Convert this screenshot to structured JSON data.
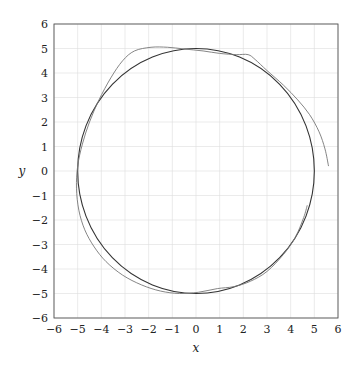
{
  "chart_data": {
    "type": "line",
    "title": "",
    "xlabel": "x",
    "ylabel": "y",
    "xlim": [
      -6,
      6
    ],
    "ylim": [
      -6,
      6
    ],
    "xticks": [
      -6,
      -5,
      -4,
      -3,
      -2,
      -1,
      0,
      1,
      2,
      3,
      4,
      5,
      6
    ],
    "yticks": [
      -6,
      -5,
      -4,
      -3,
      -2,
      -1,
      0,
      1,
      2,
      3,
      4,
      5,
      6
    ],
    "xtick_labels": [
      "−6",
      "−5",
      "−4",
      "−3",
      "−2",
      "−1",
      "0",
      "1",
      "2",
      "3",
      "4",
      "5",
      "6"
    ],
    "ytick_labels": [
      "−6",
      "−5",
      "−4",
      "−3",
      "−2",
      "−1",
      "0",
      "1",
      "2",
      "3",
      "4",
      "5",
      "6"
    ],
    "grid": true,
    "legend": null,
    "series": [
      {
        "name": "circle r=5",
        "color": "#333333",
        "width": 1.1,
        "description": "Reference circle of radius 5 centered at origin",
        "parametric": {
          "cx": 0,
          "cy": 0,
          "r": 5
        }
      },
      {
        "name": "approximate trajectory",
        "color": "#777777",
        "width": 0.9,
        "description": "Perturbed closed curve following the circle, with deviations at top-left, top-right and right side",
        "points": [
          [
            5.6,
            0.2
          ],
          [
            5.45,
            0.9
          ],
          [
            5.2,
            1.6
          ],
          [
            4.8,
            2.3
          ],
          [
            4.3,
            2.9
          ],
          [
            3.7,
            3.5
          ],
          [
            3.0,
            4.1
          ],
          [
            2.5,
            4.55
          ],
          [
            2.2,
            4.75
          ],
          [
            1.7,
            4.75
          ],
          [
            1.0,
            4.8
          ],
          [
            0.3,
            4.9
          ],
          [
            -0.5,
            4.98
          ],
          [
            -1.2,
            5.05
          ],
          [
            -1.9,
            5.05
          ],
          [
            -2.6,
            4.9
          ],
          [
            -3.1,
            4.5
          ],
          [
            -3.6,
            3.8
          ],
          [
            -4.1,
            2.9
          ],
          [
            -4.5,
            2.0
          ],
          [
            -4.8,
            1.1
          ],
          [
            -5.0,
            0.2
          ],
          [
            -5.05,
            -0.7
          ],
          [
            -4.95,
            -1.6
          ],
          [
            -4.7,
            -2.4
          ],
          [
            -4.3,
            -3.1
          ],
          [
            -3.8,
            -3.7
          ],
          [
            -3.1,
            -4.25
          ],
          [
            -2.3,
            -4.65
          ],
          [
            -1.5,
            -4.9
          ],
          [
            -0.7,
            -5.0
          ],
          [
            0.1,
            -4.95
          ],
          [
            0.9,
            -4.8
          ],
          [
            1.6,
            -4.72
          ],
          [
            2.3,
            -4.5
          ],
          [
            3.0,
            -4.1
          ],
          [
            3.7,
            -3.4
          ],
          [
            4.2,
            -2.7
          ],
          [
            4.55,
            -1.9
          ],
          [
            4.7,
            -1.4
          ]
        ]
      }
    ],
    "colors": {
      "grid": "#dddddd",
      "axis": "#555555"
    }
  }
}
